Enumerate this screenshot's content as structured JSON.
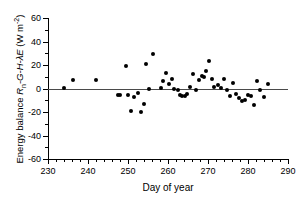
{
  "chart_data": {
    "type": "scatter",
    "title": "",
    "xlabel": "Day of year",
    "ylabel": "Energy balance Rn-G-H-λE (W m-2)",
    "ylabel_parts": {
      "prefix": "Energy balance ",
      "symbol_r": "R",
      "symbol_r_sub": "n",
      "symbol_rest": "-G-H-λE",
      "units_open": " (W m",
      "units_exp": "-2",
      "units_close": ")"
    },
    "xlim": [
      230,
      290
    ],
    "ylim": [
      -60,
      60
    ],
    "xticks": [
      230,
      240,
      250,
      260,
      270,
      280,
      290
    ],
    "yticks": [
      60,
      40,
      20,
      0,
      -20,
      -40,
      -60
    ],
    "xtick_minor_step": 2,
    "ytick_minor_step": 10,
    "grid": false,
    "legend": null,
    "zero_line": 0,
    "marker": "filled-circle",
    "marker_color": "#000000",
    "x": [
      234.0,
      236.2,
      242.0,
      247.4,
      248.0,
      249.6,
      250.1,
      250.7,
      251.5,
      252.5,
      253.2,
      254.0,
      254.6,
      255.2,
      256.3,
      258.2,
      258.8,
      259.5,
      260.2,
      261.0,
      261.6,
      262.4,
      263.0,
      263.6,
      264.2,
      264.8,
      265.6,
      266.3,
      267.0,
      267.8,
      268.4,
      269.0,
      269.6,
      270.3,
      271.0,
      271.6,
      272.5,
      273.2,
      274.0,
      274.8,
      275.5,
      276.2,
      277.0,
      277.8,
      278.5,
      279.3,
      280.0,
      280.8,
      281.5,
      282.3,
      283.0,
      284.0,
      285.0
    ],
    "y": [
      0.3,
      7.0,
      7.0,
      -5.2,
      -5.2,
      19.0,
      -5.5,
      -19.0,
      -7.0,
      -4.0,
      -20.3,
      -13.5,
      21.0,
      -0.5,
      29.5,
      0.5,
      6.0,
      13.0,
      4.0,
      8.5,
      0.0,
      -1.0,
      -5.5,
      -6.5,
      -6.0,
      -4.5,
      1.5,
      12.0,
      -1.0,
      7.0,
      10.5,
      10.0,
      15.0,
      23.5,
      8.0,
      1.0,
      3.0,
      0.5,
      8.0,
      -1.5,
      -6.0,
      5.0,
      -5.0,
      -8.0,
      -10.5,
      -9.5,
      -5.5,
      -6.0,
      -14.0,
      6.0,
      -1.0,
      -7.5,
      4.0
    ]
  },
  "axes": {
    "x_title": "Day of year",
    "y_title": "Energy balance"
  }
}
